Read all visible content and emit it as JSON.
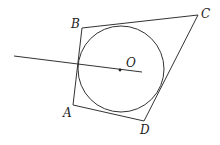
{
  "diagram": {
    "type": "geometry",
    "labels": {
      "A": "A",
      "B": "B",
      "C": "C",
      "D": "D",
      "O": "O"
    },
    "points": {
      "A": [
        73,
        105
      ],
      "B": [
        82,
        28
      ],
      "C": [
        198,
        15
      ],
      "D": [
        144,
        121
      ],
      "O": [
        120,
        70
      ]
    },
    "circle": {
      "center": "O",
      "cx": 121,
      "cy": 69,
      "r": 43
    },
    "ray": {
      "from": [
        14,
        56
      ],
      "to": [
        142,
        72
      ]
    },
    "colors": {
      "stroke": "#333333",
      "text": "#222222",
      "background": "#ffffff"
    }
  }
}
